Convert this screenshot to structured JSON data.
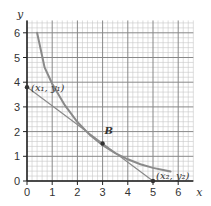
{
  "chart_data": {
    "type": "line",
    "title": "",
    "xlabel": "x",
    "ylabel": "y",
    "xlim": [
      0,
      6.6
    ],
    "ylim": [
      0,
      6.5
    ],
    "grid": true,
    "grid_minor_step": 0.2,
    "grid_major_step": 1,
    "x_ticks": [
      "0",
      "1",
      "2",
      "3",
      "4",
      "5",
      "6"
    ],
    "y_ticks": [
      "0",
      "1",
      "2",
      "3",
      "4",
      "5",
      "6"
    ],
    "series": [
      {
        "name": "curve",
        "color": "#8a8a8a",
        "points": [
          [
            0.4,
            6.0
          ],
          [
            0.7,
            4.6
          ],
          [
            1.0,
            3.94
          ],
          [
            1.5,
            3.07
          ],
          [
            2.0,
            2.39
          ],
          [
            2.5,
            1.86
          ],
          [
            3.0,
            1.45
          ],
          [
            3.5,
            1.13
          ],
          [
            4.0,
            0.88
          ],
          [
            4.5,
            0.68
          ],
          [
            5.0,
            0.53
          ],
          [
            5.5,
            0.42
          ],
          [
            5.7,
            0.38
          ]
        ]
      },
      {
        "name": "tangent-line",
        "color": "#8a8a8a",
        "points": [
          [
            0,
            3.8
          ],
          [
            5,
            0
          ]
        ]
      }
    ],
    "points": [
      {
        "name": "point-x1-y1",
        "x": 0,
        "y": 3.8,
        "label": "(x₁, y₁)"
      },
      {
        "name": "point-b",
        "x": 3,
        "y": 1.52,
        "label": "B"
      },
      {
        "name": "point-x2-y2",
        "x": 5,
        "y": 0,
        "label": "(x₂, y₂)"
      }
    ]
  }
}
